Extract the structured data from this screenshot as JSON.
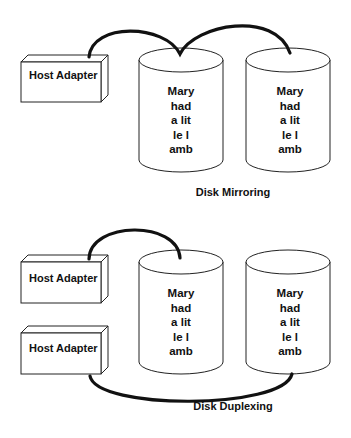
{
  "mirroring": {
    "caption": "Disk Mirroring",
    "adapter_label": "Host Adapter",
    "disk1_lines": [
      "Mary",
      "had",
      "a lit",
      "le l",
      "amb"
    ],
    "disk2_lines": [
      "Mary",
      "had",
      "a lit",
      "le l",
      "amb"
    ]
  },
  "duplexing": {
    "caption": "Disk Duplexing",
    "adapter1_label": "Host Adapter",
    "adapter2_label": "Host Adapter",
    "disk1_lines": [
      "Mary",
      "had",
      "a lit",
      "le l",
      "amb"
    ],
    "disk2_lines": [
      "Mary",
      "had",
      "a lit",
      "le l",
      "amb"
    ]
  }
}
